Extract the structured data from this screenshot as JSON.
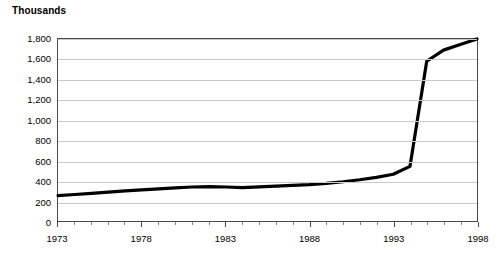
{
  "chart_data": {
    "type": "line",
    "title": "",
    "ylabel": "Thousands",
    "xlabel": "",
    "ylim": [
      0,
      1800
    ],
    "xlim": [
      1973,
      1998
    ],
    "grid": true,
    "legend": null,
    "y_ticks": [
      0,
      200,
      400,
      600,
      800,
      1000,
      1200,
      1400,
      1600,
      1800
    ],
    "y_tick_labels": [
      "0",
      "200",
      "400",
      "600",
      "800",
      "1,000",
      "1,200",
      "1,400",
      "1,600",
      "1,800"
    ],
    "x_ticks": [
      1973,
      1978,
      1983,
      1988,
      1993,
      1998
    ],
    "x_tick_labels": [
      "1973",
      "1978",
      "1983",
      "1988",
      "1993",
      "1998"
    ],
    "x_minor_ticks": [
      1974,
      1975,
      1976,
      1977,
      1979,
      1980,
      1981,
      1982,
      1984,
      1985,
      1986,
      1987,
      1989,
      1990,
      1991,
      1992,
      1994,
      1995,
      1996,
      1997
    ],
    "line_color": "#000000",
    "line_width": 3.2,
    "x": [
      1973,
      1974,
      1975,
      1976,
      1977,
      1978,
      1979,
      1980,
      1981,
      1982,
      1983,
      1984,
      1985,
      1986,
      1987,
      1988,
      1989,
      1990,
      1991,
      1992,
      1993,
      1994,
      1995,
      1996,
      1997,
      1998
    ],
    "values": [
      250,
      262,
      274,
      286,
      298,
      308,
      318,
      328,
      336,
      340,
      336,
      330,
      338,
      345,
      352,
      360,
      372,
      388,
      408,
      432,
      462,
      540,
      1580,
      1690,
      1745,
      1800
    ]
  }
}
